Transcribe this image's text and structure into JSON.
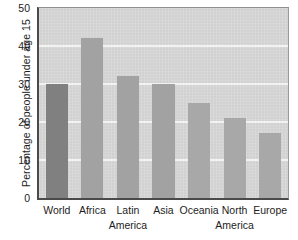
{
  "chart_data": {
    "type": "bar",
    "title": "",
    "subtitle": "",
    "xlabel": "",
    "ylabel": "Percentage of people under age 15",
    "categories": [
      "World",
      "Africa",
      "Latin America",
      "Asia",
      "Oceania",
      "North America",
      "Europe"
    ],
    "category_lines": [
      [
        "World",
        ""
      ],
      [
        "Africa",
        ""
      ],
      [
        "Latin",
        "America"
      ],
      [
        "Asia",
        ""
      ],
      [
        "Oceania",
        ""
      ],
      [
        "North",
        "America"
      ],
      [
        "Europe",
        ""
      ]
    ],
    "values": [
      30,
      42,
      32,
      30,
      25,
      21,
      17
    ],
    "ylim": [
      0,
      50
    ],
    "yticks": [
      0,
      10,
      20,
      30,
      40,
      50
    ],
    "ytick_labels": [
      "0",
      "10",
      "20",
      "30",
      "40",
      "50"
    ],
    "grid": true,
    "gridlines_at": [
      10,
      20,
      30,
      40
    ],
    "legend": "none",
    "bar_colors": [
      "#808080",
      "#a2a2a2",
      "#a2a2a2",
      "#a2a2a2",
      "#a8a8a8",
      "#a8a8a8",
      "#a8a8a8"
    ],
    "plot_background": "#d6d6d6",
    "gridline_color": "#f2f2f2",
    "axis_color": "#4a4a4a",
    "text_color": "#1d1d1d"
  }
}
